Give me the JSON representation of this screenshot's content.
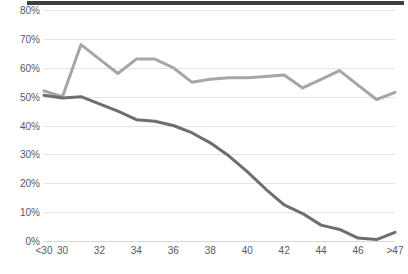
{
  "chart_data": {
    "type": "line",
    "title": "",
    "subtitle": "",
    "xlabel": "",
    "ylabel": "",
    "ylim": [
      0,
      80
    ],
    "xlim_categories": [
      "<30",
      "30",
      "31",
      "32",
      "33",
      "34",
      "35",
      "36",
      "37",
      "38",
      "39",
      "40",
      "41",
      "42",
      "43",
      "44",
      "45",
      "46",
      "47",
      ">47"
    ],
    "categories": [
      "<30",
      "30",
      "31",
      "32",
      "33",
      "34",
      "35",
      "36",
      "37",
      "38",
      "39",
      "40",
      "41",
      "42",
      "43",
      "44",
      "45",
      "46",
      "47",
      ">47"
    ],
    "x_tick_labels": [
      "<30",
      "30",
      "",
      "32",
      "",
      "34",
      "",
      "36",
      "",
      "38",
      "",
      "40",
      "",
      "42",
      "",
      "44",
      "",
      "46",
      "",
      ">47"
    ],
    "y_tick_labels": [
      "0%",
      "10%",
      "20%",
      "30%",
      "40%",
      "50%",
      "60%",
      "70%",
      "80%"
    ],
    "y_tick_values": [
      0,
      10,
      20,
      30,
      40,
      50,
      60,
      70,
      80
    ],
    "grid": true,
    "legend_position": "none",
    "series": [
      {
        "name": "upper-series",
        "color": "#a6a6a6",
        "values": [
          52,
          50,
          68,
          63,
          58,
          63,
          63,
          60,
          55,
          56,
          56.5,
          56.5,
          57,
          57.5,
          53,
          56,
          59,
          54,
          49,
          51.5
        ]
      },
      {
        "name": "lower-series",
        "color": "#6e6e6e",
        "values": [
          50.5,
          49.5,
          50,
          47.5,
          45,
          42,
          41.5,
          40,
          37.5,
          34,
          29.5,
          24,
          18,
          12.5,
          9.5,
          5.5,
          4,
          1,
          0.5,
          3
        ]
      }
    ]
  },
  "colors": {
    "upper_series": "#a6a6a6",
    "lower_series": "#6e6e6e",
    "gridline": "#e4e4e4",
    "baseline": "#d8d8d8",
    "tick_text": "#59595b",
    "top_bar": "#3f3f3f",
    "background": "#ffffff"
  }
}
